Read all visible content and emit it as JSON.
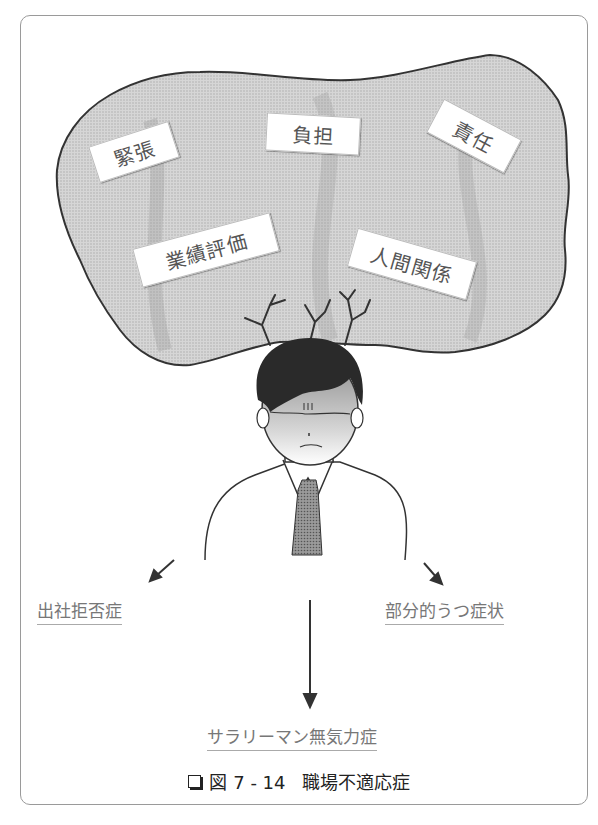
{
  "figure": {
    "caption_icon": "box-icon",
    "caption_number": "図 7 - 14",
    "caption_title": "職場不適応症"
  },
  "stressors": [
    {
      "label": "緊張"
    },
    {
      "label": "負担"
    },
    {
      "label": "責任"
    },
    {
      "label": "業績評価"
    },
    {
      "label": "人間関係"
    }
  ],
  "outcomes": {
    "left": "出社拒否症",
    "right": "部分的うつ症状",
    "center": "サラリーマン無気力症"
  },
  "colors": {
    "cloud_fill": "#c8c8c8",
    "outline": "#333333",
    "hair": "#2a2a2a",
    "tie": "#8a8a8a"
  }
}
